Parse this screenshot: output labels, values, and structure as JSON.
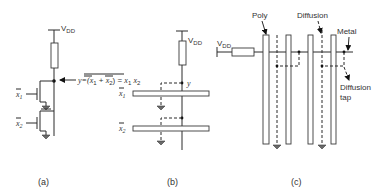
{
  "panel_a": {
    "vdd_label": "V",
    "vdd_sub": "DD",
    "output_eq_prefix": "y=(",
    "x1": "x",
    "x1_sub": "1",
    "plus": " + ",
    "x2": "x",
    "x2_sub": "2",
    "output_eq_suffix": ") = ",
    "rhs_x1": "x",
    "rhs_x1_sub": "1",
    "rhs_x2": "x",
    "rhs_x2_sub": "2",
    "input1": "x",
    "input1_sub": "1",
    "input2": "x",
    "input2_sub": "2",
    "caption": "(a)"
  },
  "panel_b": {
    "vdd_label": "V",
    "vdd_sub": "DD",
    "output_label": "y",
    "input1": "x",
    "input1_sub": "1",
    "input2": "x",
    "input2_sub": "2",
    "caption": "(b)"
  },
  "panel_c": {
    "vdd_label": "V",
    "vdd_sub": "DD",
    "poly_label": "Poly",
    "diffusion_label": "Diffusion",
    "metal_label": "Metal",
    "diffusion_tap_label_line1": "Diffusion",
    "diffusion_tap_label_line2": "tap",
    "caption": "(c)"
  }
}
